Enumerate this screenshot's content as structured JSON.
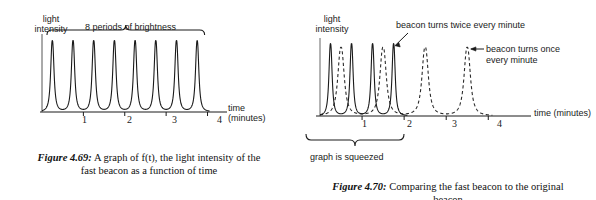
{
  "figure_left": {
    "caption_label": "Figure 4.69:",
    "caption_text": " A graph of f(t), the light intensity of the\nfast beacon as a function of time",
    "y_axis_label_line1": "light",
    "y_axis_label_line2": "intensity",
    "x_axis_label_line1": "time",
    "x_axis_label_line2": "(minutes)",
    "brace_label": "8 periods of brightness",
    "tick_labels": [
      "1",
      "2",
      "3",
      "4"
    ],
    "chart_data": {
      "type": "line",
      "title": "A graph of f(t), the light intensity of the fast beacon as a function of time",
      "xlabel": "time (minutes)",
      "ylabel": "light intensity",
      "xlim": [
        0,
        4.35
      ],
      "ylim": [
        0,
        1.05
      ],
      "grid": false,
      "legend": "none",
      "xticks": [
        1,
        2,
        3,
        4
      ],
      "annotations": [
        "8 periods of brightness"
      ],
      "series": [
        {
          "name": "fast beacon f(t)",
          "style": "solid",
          "color": "#1a1a1a",
          "period": 0.5,
          "peak_count": 8,
          "peak_times": [
            0.25,
            0.75,
            1.25,
            1.75,
            2.25,
            2.75,
            3.25,
            3.75
          ],
          "peak_value": 1.0,
          "baseline_value": 0.0,
          "spike_width": 0.09
        }
      ]
    }
  },
  "figure_right": {
    "caption_label": "Figure 4.70:",
    "caption_text": " Comparing the fast beacon to the original\nbeacon",
    "y_axis_label_line1": "light",
    "y_axis_label_line2": "intensity",
    "x_axis_label": "time (minutes)",
    "annotation_fast": "beacon turns twice every minute",
    "annotation_slow_line1": "beacon turns once",
    "annotation_slow_line2": "every minute",
    "brace_label": "graph is squeezed",
    "tick_labels": [
      "1",
      "2",
      "3",
      "4"
    ],
    "chart_data": {
      "type": "line",
      "title": "Comparing the fast beacon to the original beacon",
      "xlabel": "time (minutes)",
      "ylabel": "light intensity",
      "xlim": [
        0,
        4.35
      ],
      "ylim": [
        0,
        1.05
      ],
      "grid": false,
      "legend": "annotations",
      "xticks": [
        1,
        2,
        3,
        4
      ],
      "annotations": [
        "beacon turns twice every minute",
        "beacon turns once every minute",
        "graph is squeezed"
      ],
      "series": [
        {
          "name": "fast beacon (squeezed)",
          "style": "solid",
          "color": "#1a1a1a",
          "period": 0.5,
          "peak_count": 4,
          "peak_times": [
            0.25,
            0.75,
            1.25,
            1.75
          ],
          "peak_value": 1.0,
          "baseline_value": 0.0,
          "spike_width": 0.085
        },
        {
          "name": "original beacon",
          "style": "dashed",
          "color": "#2a2a2a",
          "period": 1.0,
          "peak_count": 4,
          "peak_times": [
            0.5,
            1.5,
            2.5,
            3.5
          ],
          "peak_value": 0.95,
          "baseline_value": 0.0,
          "spike_width": 0.17
        }
      ]
    }
  }
}
